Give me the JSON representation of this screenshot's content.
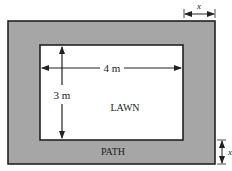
{
  "diagram": {
    "type": "lawn-and-path",
    "outer_label": "PATH",
    "inner_label": "LAWN",
    "width_label": "4 m",
    "height_label": "3 m",
    "path_width_top_label": "x",
    "path_width_side_label": "x",
    "colors": {
      "path": "#a6a6a6",
      "lawn": "#ffffff",
      "border": "#222222"
    }
  }
}
